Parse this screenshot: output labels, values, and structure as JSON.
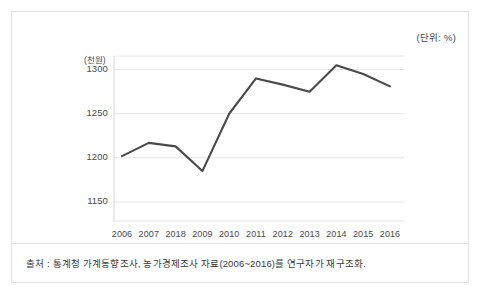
{
  "figure": {
    "unit_note": "(단위: %)",
    "y_unit_label": "(천원)",
    "source_note": "출처 : 통계청 가계동향조사, 농가경제조사 자료(2006~2016)를 연구자가 재구조화."
  },
  "chart_data": {
    "type": "line",
    "title": "",
    "subtitle": "",
    "xlabel": "",
    "ylabel": "(천원)",
    "unit_note": "(단위: %)",
    "categories": [
      "2006",
      "2007",
      "2018",
      "2009",
      "2010",
      "2011",
      "2012",
      "2013",
      "2014",
      "2015",
      "2016"
    ],
    "values": [
      1202,
      1217,
      1213,
      1185,
      1250,
      1290,
      1283,
      1275,
      1305,
      1295,
      1281
    ],
    "series": [
      {
        "name": "",
        "values": [
          1202,
          1217,
          1213,
          1185,
          1250,
          1290,
          1283,
          1275,
          1305,
          1295,
          1281
        ]
      }
    ],
    "ylim": [
      1125,
      1320
    ],
    "ytick_labels": [
      "1300",
      "1250",
      "1200",
      "1150"
    ],
    "yticks": [
      1300,
      1250,
      1200,
      1150
    ],
    "grid": true,
    "grid_axis": "y",
    "legend": false,
    "legend_position": "none",
    "markers": false,
    "line_color": "#4a4a4a",
    "grid_color": "#e4e4e4",
    "axis_color": "#d8d8d8",
    "text_color": "#4a4a4a",
    "background_color": "#ffffff",
    "annotations": []
  }
}
